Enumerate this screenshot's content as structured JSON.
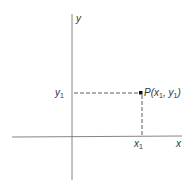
{
  "diagram": {
    "axis_labels": {
      "x": "x",
      "y": "y"
    },
    "point": {
      "name": "P",
      "label": "P(x",
      "coord_x": "x",
      "coord_y": "y",
      "sub": "1"
    },
    "x_tick_label": {
      "base": "x",
      "sub": "1"
    },
    "y_tick_label": {
      "base": "y",
      "sub": "1"
    },
    "colors": {
      "axis": "#555555",
      "dashed": "#333333",
      "point": "#111111",
      "text": "#333333"
    }
  }
}
